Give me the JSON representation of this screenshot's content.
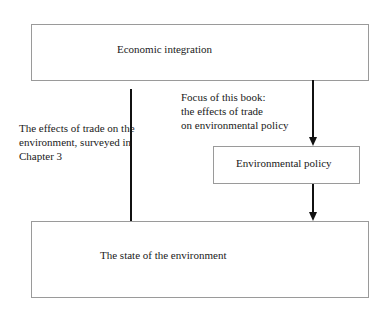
{
  "diagram": {
    "nodes": [
      {
        "id": "economic-integration",
        "label": "Economic integration"
      },
      {
        "id": "environmental-policy",
        "label": "Environmental policy"
      },
      {
        "id": "state-of-environment",
        "label": "The state of the environment"
      }
    ],
    "edges": [
      {
        "from": "economic-integration",
        "to": "state-of-environment",
        "label": [
          "The effects of trade on the",
          "environment, surveyed in",
          "Chapter 3"
        ]
      },
      {
        "from": "economic-integration",
        "to": "environmental-policy",
        "label": [
          "Focus of this book:",
          "the effects of trade",
          "on environmental policy"
        ]
      },
      {
        "from": "environmental-policy",
        "to": "state-of-environment",
        "label": []
      }
    ]
  }
}
